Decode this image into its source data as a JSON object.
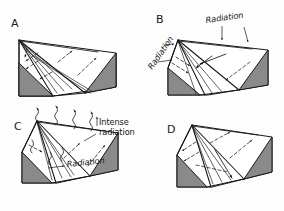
{
  "figure": {
    "type": "scientific-diagram",
    "background_color": "#fdfdfd",
    "line_color": "#171717",
    "shaded_face_color": "#8a8a8a",
    "top_face_color": "#ffffff",
    "front_face_color": "#fbfbfb"
  },
  "panels": [
    {
      "id": "A",
      "letter": "A",
      "labels": []
    },
    {
      "id": "B",
      "letter": "B",
      "labels": [
        {
          "text": "Radiation",
          "rotation": -8
        },
        {
          "text": "Radiation",
          "rotation": -55
        }
      ]
    },
    {
      "id": "C",
      "letter": "C",
      "labels": [
        {
          "text": "Intense",
          "rotation": 0
        },
        {
          "text": "radiation",
          "rotation": 0
        },
        {
          "text": "Radiation",
          "rotation": -6
        }
      ]
    },
    {
      "id": "D",
      "letter": "D",
      "labels": []
    }
  ],
  "text": {
    "letter_a": "A",
    "letter_b": "B",
    "letter_c": "C",
    "letter_d": "D",
    "radiation_b_top": "Radiation",
    "radiation_b_left": "Radiation",
    "intense_line1": "Intense",
    "intense_line2": "radiation",
    "radiation_c": "Radiation"
  }
}
